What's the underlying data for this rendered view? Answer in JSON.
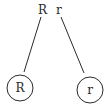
{
  "diagram": {
    "parent": {
      "alleles": [
        "R",
        "r"
      ]
    },
    "gametes": [
      {
        "label": "R"
      },
      {
        "label": "r"
      }
    ],
    "colors": {
      "stroke": "#2a2a2a",
      "background": "#ffffff"
    }
  }
}
